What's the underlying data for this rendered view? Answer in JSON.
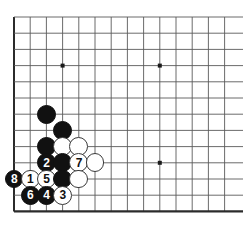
{
  "diagram": {
    "kind": "go-board-diagram",
    "board": {
      "origin_x": 14,
      "origin_y": 17,
      "step": 16.2,
      "cols_visible": 14,
      "rows_visible": 12,
      "line_color": "#5a5a5a",
      "edge_color": "#2b2b2b",
      "background": "#ffffff",
      "stone_radius": 9.4
    },
    "star_points": [
      {
        "name": "star-point-upper-left",
        "col": 3,
        "row": 3
      },
      {
        "name": "star-point-upper-right",
        "col": 9,
        "row": 3
      },
      {
        "name": "star-point-lower-right",
        "col": 9,
        "row": 9
      }
    ],
    "stones": [
      {
        "id": "stone-black-a",
        "color": "black",
        "label": "",
        "col": 2,
        "row": 6
      },
      {
        "id": "stone-black-b",
        "color": "black",
        "label": "",
        "col": 3,
        "row": 7
      },
      {
        "id": "stone-black-c",
        "color": "black",
        "label": "",
        "col": 2,
        "row": 8
      },
      {
        "id": "stone-white-a",
        "color": "white",
        "label": "",
        "col": 3,
        "row": 8
      },
      {
        "id": "stone-white-b",
        "color": "white",
        "label": "",
        "col": 4,
        "row": 8
      },
      {
        "id": "stone-move-2",
        "color": "black",
        "label": "2",
        "col": 2,
        "row": 9
      },
      {
        "id": "stone-black-d",
        "color": "black",
        "label": "",
        "col": 3,
        "row": 9
      },
      {
        "id": "stone-move-7",
        "color": "white",
        "label": "7",
        "col": 4,
        "row": 9
      },
      {
        "id": "stone-white-c",
        "color": "white",
        "label": "",
        "col": 5,
        "row": 9
      },
      {
        "id": "stone-move-8",
        "color": "black",
        "label": "8",
        "col": 0,
        "row": 10
      },
      {
        "id": "stone-move-1",
        "color": "white",
        "label": "1",
        "col": 1,
        "row": 10
      },
      {
        "id": "stone-move-5",
        "color": "white",
        "label": "5",
        "col": 2,
        "row": 10
      },
      {
        "id": "stone-black-e",
        "color": "black",
        "label": "",
        "col": 3,
        "row": 10
      },
      {
        "id": "stone-white-d",
        "color": "white",
        "label": "",
        "col": 4,
        "row": 10
      },
      {
        "id": "stone-move-6",
        "color": "black",
        "label": "6",
        "col": 1,
        "row": 11
      },
      {
        "id": "stone-move-4",
        "color": "black",
        "label": "4",
        "col": 2,
        "row": 11
      },
      {
        "id": "stone-move-3",
        "color": "white",
        "label": "3",
        "col": 3,
        "row": 11
      }
    ],
    "move_sequence": [
      {
        "move": "1",
        "color": "white"
      },
      {
        "move": "2",
        "color": "black"
      },
      {
        "move": "3",
        "color": "white"
      },
      {
        "move": "4",
        "color": "black"
      },
      {
        "move": "5",
        "color": "white"
      },
      {
        "move": "6",
        "color": "black"
      },
      {
        "move": "7",
        "color": "white"
      },
      {
        "move": "8",
        "color": "black"
      }
    ]
  }
}
